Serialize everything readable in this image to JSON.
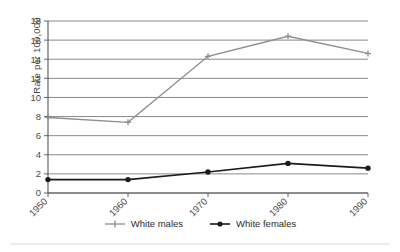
{
  "chart_data": {
    "type": "line",
    "title": "",
    "xlabel": "",
    "ylabel": "Rate per 100,000",
    "categories": [
      "1950",
      "1960",
      "1970",
      "1980",
      "1990"
    ],
    "ylim": [
      0,
      18
    ],
    "ytick_values": [
      0,
      2,
      4,
      6,
      8,
      10,
      12,
      14,
      16,
      18
    ],
    "ytick_labels": [
      "0",
      "2",
      "4",
      "6",
      "8",
      "10",
      "12",
      "14",
      "16",
      "18"
    ],
    "grid": true,
    "legend_position": "bottom",
    "series": [
      {
        "name": "White males",
        "values": [
          7.9,
          7.4,
          14.3,
          16.4,
          14.6
        ],
        "color": "#8d8d8d",
        "marker": "cross"
      },
      {
        "name": "White females",
        "values": [
          1.4,
          1.4,
          2.2,
          3.1,
          2.6
        ],
        "color": "#1c1c1c",
        "marker": "circle"
      }
    ]
  },
  "legend": {
    "items": [
      {
        "label": "White males"
      },
      {
        "label": "White females"
      }
    ]
  },
  "axis": {
    "y_title": "Rate per 100,000"
  }
}
